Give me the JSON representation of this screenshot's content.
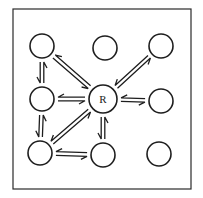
{
  "diagram": {
    "type": "network-graph",
    "frame": {
      "x": 13,
      "y": 9,
      "width": 178,
      "height": 180,
      "stroke": "#2a2a2a"
    },
    "colors": {
      "stroke": "#1e1e1e",
      "background": "#ffffff"
    },
    "nodes": [
      {
        "id": "TL",
        "label": "",
        "cx": 42,
        "cy": 46,
        "r": 12
      },
      {
        "id": "TM",
        "label": "",
        "cx": 105,
        "cy": 48,
        "r": 12
      },
      {
        "id": "TR",
        "label": "",
        "cx": 161,
        "cy": 46,
        "r": 12
      },
      {
        "id": "ML",
        "label": "",
        "cx": 42,
        "cy": 99,
        "r": 12
      },
      {
        "id": "R",
        "label": "R",
        "cx": 103,
        "cy": 99,
        "r": 14
      },
      {
        "id": "MR",
        "label": "",
        "cx": 161,
        "cy": 101,
        "r": 12
      },
      {
        "id": "BL",
        "label": "",
        "cx": 40,
        "cy": 153,
        "r": 12
      },
      {
        "id": "BM",
        "label": "",
        "cx": 103,
        "cy": 155,
        "r": 12
      },
      {
        "id": "BR",
        "label": "",
        "cx": 159,
        "cy": 154,
        "r": 12
      }
    ],
    "edges": [
      {
        "from": "TL",
        "to": "ML",
        "kind": "reversible"
      },
      {
        "from": "TL",
        "to": "R",
        "kind": "reversible"
      },
      {
        "from": "TR",
        "to": "R",
        "kind": "reversible"
      },
      {
        "from": "ML",
        "to": "R",
        "kind": "reversible"
      },
      {
        "from": "R",
        "to": "MR",
        "kind": "reversible"
      },
      {
        "from": "ML",
        "to": "BL",
        "kind": "reversible"
      },
      {
        "from": "BL",
        "to": "R",
        "kind": "reversible"
      },
      {
        "from": "R",
        "to": "BM",
        "kind": "reversible"
      },
      {
        "from": "BL",
        "to": "BM",
        "kind": "reversible"
      }
    ],
    "isolated_nodes": [
      "TM",
      "BR"
    ],
    "center_label": "R"
  }
}
